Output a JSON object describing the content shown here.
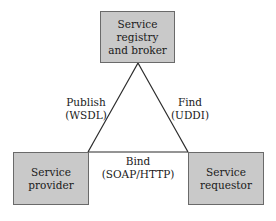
{
  "diagram": {
    "type": "SOA triangle",
    "colors": {
      "node_fill": "#c9c9c9",
      "node_border": "#6a6a6a",
      "edge": "#2a2a2a",
      "background": "#ffffff"
    },
    "nodes": {
      "registry": {
        "line1": "Service registry",
        "line2": "and broker"
      },
      "provider": {
        "line1": "Service provider"
      },
      "requestor": {
        "line1": "Service",
        "line2": "requestor"
      }
    },
    "edges": {
      "publish": {
        "line1": "Publish",
        "line2": "(WSDL)",
        "from": "provider",
        "to": "registry"
      },
      "find": {
        "line1": "Find",
        "line2": "(UDDI)",
        "from": "requestor",
        "to": "registry"
      },
      "bind": {
        "line1": "Bind",
        "line2": "(SOAP/HTTP)",
        "from": "requestor",
        "to": "provider"
      }
    }
  }
}
